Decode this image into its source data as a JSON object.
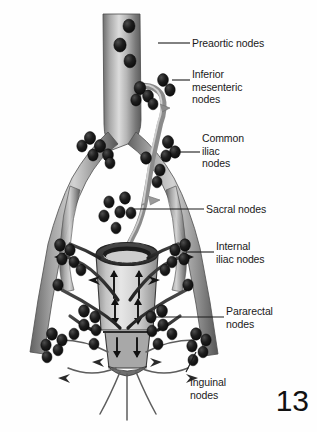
{
  "figure": {
    "page_number": "13",
    "background_color": "#fefefe",
    "ink_color": "#1a1a1a",
    "node_color": "#151515",
    "vessel_color": "#9a9a9a"
  },
  "labels": [
    {
      "id": "preaortic",
      "text": "Preaortic nodes",
      "x": 192,
      "y": 37,
      "leader": {
        "x1": 158,
        "y1": 43,
        "x2": 190,
        "y2": 43
      }
    },
    {
      "id": "inferior-mesenteric",
      "text": "Inferior\nmesenteric\nnodes",
      "x": 192,
      "y": 68,
      "leader": {
        "x1": 172,
        "y1": 80,
        "x2": 190,
        "y2": 80
      }
    },
    {
      "id": "common-iliac",
      "text": "Common\niliac\nnodes",
      "x": 202,
      "y": 132,
      "leader": {
        "x1": 176,
        "y1": 152,
        "x2": 200,
        "y2": 152
      }
    },
    {
      "id": "sacral",
      "text": "Sacral nodes",
      "x": 206,
      "y": 203,
      "leader": {
        "x1": 134,
        "y1": 209,
        "x2": 204,
        "y2": 209
      }
    },
    {
      "id": "internal-iliac",
      "text": "Internal\niliac nodes",
      "x": 216,
      "y": 240,
      "leader": {
        "x1": 186,
        "y1": 252,
        "x2": 214,
        "y2": 252
      }
    },
    {
      "id": "pararectal",
      "text": "Pararectal\nnodes",
      "x": 226,
      "y": 305,
      "leader": {
        "x1": 152,
        "y1": 317,
        "x2": 224,
        "y2": 317
      }
    },
    {
      "id": "inguinal",
      "text": "Inguinal\nnodes",
      "x": 190,
      "y": 376,
      "leader": {
        "x1": 196,
        "y1": 352,
        "x2": 186,
        "y2": 372
      }
    }
  ],
  "anatomy": {
    "structures": [
      "abdominal aorta",
      "inferior mesenteric artery",
      "common iliac arteries",
      "internal iliac arteries",
      "external iliac arteries",
      "superior rectal artery",
      "rectum",
      "anal canal"
    ],
    "flow_arrow_count": 8,
    "lymph_node_groups": [
      "preaortic",
      "inferior mesenteric",
      "common iliac",
      "sacral",
      "internal iliac",
      "pararectal",
      "inguinal"
    ]
  }
}
